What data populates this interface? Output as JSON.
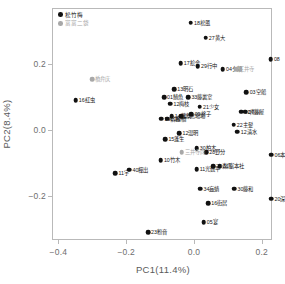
{
  "chart_data": {
    "type": "scatter",
    "title": "",
    "xlabel": "PC1(11.4%)",
    "ylabel": "PC2(8.4%)",
    "xlim": [
      -0.4189,
      0.2302
    ],
    "ylim": [
      -0.3342,
      0.3688
    ],
    "xticks": [
      -0.4,
      -0.2,
      0.0,
      0.2
    ],
    "xtick_labels": [
      "-0.4",
      "-0.2",
      "0.0",
      "0.2"
    ],
    "yticks": [
      0.2,
      0.0,
      -0.2
    ],
    "ytick_labels": [
      "0.2",
      "0.0",
      "-0.2"
    ],
    "grid": false,
    "legend_position": "top-left",
    "series": [
      {
        "name": "松竹梅",
        "color": "#111111"
      },
      {
        "name": "富富二袋",
        "color": "#a8a8a8"
      }
    ],
    "points": [
      {
        "label": "18松風",
        "x": -0.0094,
        "y": 0.324,
        "group": 0
      },
      {
        "label": "27黄大",
        "x": 0.034,
        "y": 0.2786,
        "group": 0
      },
      {
        "label": "17絵合",
        "x": -0.0396,
        "y": 0.2018,
        "group": 0
      },
      {
        "label": "29行中",
        "x": 0.0113,
        "y": 0.1924,
        "group": 0
      },
      {
        "label": "04夕顔",
        "x": 0.085,
        "y": 0.1829,
        "group": 0
      },
      {
        "label": "三井寺",
        "x": 0.1246,
        "y": 0.1829,
        "group": 1
      },
      {
        "label": "08",
        "x": 0.2264,
        "y": 0.2131,
        "group": 0
      },
      {
        "label": "橋弁庆",
        "x": -0.3,
        "y": 0.1527,
        "group": 1
      },
      {
        "label": "13明石",
        "x": -0.0585,
        "y": 0.1225,
        "group": 0
      },
      {
        "label": "03空船",
        "x": 0.1548,
        "y": 0.113,
        "group": 0
      },
      {
        "label": "01鯖魚",
        "x": -0.0887,
        "y": 0.0979,
        "group": 0
      },
      {
        "label": "33藤裏室",
        "x": -0.017,
        "y": 0.0979,
        "group": 0
      },
      {
        "label": "16紅虫",
        "x": -0.3491,
        "y": 0.0887,
        "group": 0
      },
      {
        "label": "12梅枝",
        "x": -0.0698,
        "y": 0.079,
        "group": 0
      },
      {
        "label": "21少女",
        "x": 0.017,
        "y": 0.0696,
        "group": 0
      },
      {
        "label": "02庝川",
        "x": 0.1397,
        "y": 0.0545,
        "group": 0
      },
      {
        "label": "07藤屋",
        "x": 0.151,
        "y": 0.0545,
        "group": 0
      },
      {
        "label": "09柊子",
        "x": -0.0075,
        "y": 0.047,
        "group": 0
      },
      {
        "label": "14蓬葫",
        "x": -0.066,
        "y": 0.0413,
        "group": 0
      },
      {
        "label": "19宿寡",
        "x": -0.0962,
        "y": 0.0338,
        "group": 0
      },
      {
        "label": "10線橋",
        "x": -0.0792,
        "y": 0.0338,
        "group": 0
      },
      {
        "label": "25念場場",
        "x": -0.0377,
        "y": 0.0413,
        "group": 0
      },
      {
        "label": "22主髪",
        "x": 0.1171,
        "y": 0.0151,
        "group": 0
      },
      {
        "label": "12清水",
        "x": 0.1284,
        "y": -0.0057,
        "group": 0
      },
      {
        "label": "12温明",
        "x": -0.0434,
        "y": -0.0113,
        "group": 0
      },
      {
        "label": "15蓬生",
        "x": -0.0849,
        "y": -0.0283,
        "group": 0
      },
      {
        "label": "30柏木",
        "x": 0.0075,
        "y": -0.0566,
        "group": 0
      },
      {
        "label": "28野分",
        "x": 0.0359,
        "y": -0.0679,
        "group": 0
      },
      {
        "label": "06本輪花",
        "x": 0.2283,
        "y": -0.0754,
        "group": 0
      },
      {
        "label": "三井寺向",
        "x": -0.0358,
        "y": -0.0679,
        "group": 1
      },
      {
        "label": "10竹木",
        "x": -0.0981,
        "y": -0.0924,
        "group": 0
      },
      {
        "label": "40樿出",
        "x": -0.1906,
        "y": -0.1207,
        "group": 0
      },
      {
        "label": "11宇",
        "x": -0.2321,
        "y": -0.132,
        "group": 0
      },
      {
        "label": "11光数平",
        "x": 0.0075,
        "y": -0.1188,
        "group": 0
      },
      {
        "label": "31富本社",
        "x": 0.0755,
        "y": -0.1113,
        "group": 0
      },
      {
        "label": "26森黒",
        "x": 0.0566,
        "y": -0.1113,
        "group": 0
      },
      {
        "label": "34蝱蜻",
        "x": 0.0189,
        "y": -0.1792,
        "group": 0
      },
      {
        "label": "30藤和",
        "x": 0.119,
        "y": -0.1792,
        "group": 0
      },
      {
        "label": "20深夏",
        "x": 0.2283,
        "y": -0.2094,
        "group": 0
      },
      {
        "label": "16街居",
        "x": 0.0415,
        "y": -0.2226,
        "group": 0
      },
      {
        "label": "05宴",
        "x": 0.0283,
        "y": -0.2811,
        "group": 0
      },
      {
        "label": "23粉音",
        "x": -0.1359,
        "y": -0.3113,
        "group": 0
      }
    ]
  }
}
